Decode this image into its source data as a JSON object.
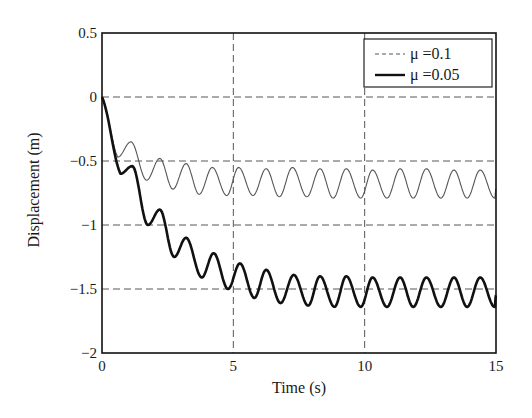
{
  "chart_data": {
    "type": "line",
    "title": "",
    "xlabel": "Time (s)",
    "ylabel": "Displacement (m)",
    "xlim": [
      0,
      15
    ],
    "ylim": [
      -2,
      0.5
    ],
    "xticks": [
      0,
      5,
      10,
      15
    ],
    "xtick_labels": [
      "0",
      "5",
      "10",
      "15"
    ],
    "yticks": [
      0.5,
      0,
      -0.5,
      -1,
      -1.5,
      -2
    ],
    "ytick_labels": [
      "0.5",
      "0",
      "−0.5",
      "−1",
      "−1.5",
      "−2"
    ],
    "grid": true,
    "legend_position": "upper right",
    "series": [
      {
        "name": "μ =0.1",
        "style": "thin-gray",
        "color": "#555555",
        "keypoints": {
          "t": [
            0,
            0.6,
            1.1,
            1.7,
            2.2,
            2.7,
            3.2,
            3.7,
            4.2,
            4.75,
            5.2,
            5.75,
            6.25,
            6.75,
            7.25,
            7.8,
            8.3,
            8.8,
            9.3,
            9.85,
            10.3,
            10.85,
            11.35,
            11.85,
            12.35,
            12.9,
            13.4,
            13.9,
            14.4,
            14.95,
            15
          ],
          "y": [
            0,
            -0.47,
            -0.35,
            -0.65,
            -0.48,
            -0.72,
            -0.52,
            -0.76,
            -0.55,
            -0.77,
            -0.55,
            -0.77,
            -0.56,
            -0.78,
            -0.55,
            -0.78,
            -0.56,
            -0.79,
            -0.56,
            -0.79,
            -0.57,
            -0.79,
            -0.56,
            -0.79,
            -0.56,
            -0.79,
            -0.57,
            -0.79,
            -0.57,
            -0.79,
            -0.72
          ]
        }
      },
      {
        "name": "μ =0.05",
        "style": "thick-black",
        "color": "#111111",
        "keypoints": {
          "t": [
            0,
            0.7,
            1.15,
            1.75,
            2.2,
            2.75,
            3.2,
            3.8,
            4.25,
            4.8,
            5.25,
            5.8,
            6.25,
            6.8,
            7.3,
            7.85,
            8.3,
            8.85,
            9.3,
            9.85,
            10.3,
            10.85,
            11.35,
            11.85,
            12.35,
            12.9,
            13.4,
            13.9,
            14.4,
            14.95,
            15
          ],
          "y": [
            0,
            -0.6,
            -0.54,
            -1.0,
            -0.88,
            -1.25,
            -1.1,
            -1.41,
            -1.22,
            -1.5,
            -1.3,
            -1.57,
            -1.35,
            -1.61,
            -1.39,
            -1.63,
            -1.4,
            -1.64,
            -1.4,
            -1.64,
            -1.41,
            -1.64,
            -1.41,
            -1.64,
            -1.41,
            -1.64,
            -1.41,
            -1.64,
            -1.41,
            -1.64,
            -1.55
          ]
        }
      }
    ]
  },
  "legend": {
    "items": [
      {
        "label": "μ =0.1"
      },
      {
        "label": "μ =0.05"
      }
    ]
  }
}
